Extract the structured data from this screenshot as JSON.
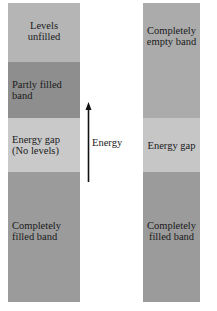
{
  "diagram": {
    "left_column": {
      "bands": [
        {
          "id": "levels-unfilled",
          "label": "Levels unfilled",
          "label_lines": [
            "Levels",
            "unfilled"
          ],
          "color": "#b5b5b5"
        },
        {
          "id": "partly-filled",
          "label": "Partly filled band",
          "label_lines": [
            "Partly filled",
            "band"
          ],
          "color": "#8e8e8e"
        },
        {
          "id": "energy-gap",
          "label": "Energy gap (No levels)",
          "label_lines": [
            "Energy gap",
            "(No levels)"
          ],
          "color": "#c9c9c9"
        },
        {
          "id": "completely-filled",
          "label": "Completely filled band",
          "label_lines": [
            "Completely",
            "filled band"
          ],
          "color": "#9b9b9b"
        }
      ]
    },
    "arrow": {
      "label": "Energy",
      "direction": "up",
      "color": "#111111"
    },
    "right_column": {
      "bands": [
        {
          "id": "completely-empty",
          "label": "Completely empty band",
          "label_lines": [
            "Completely",
            "empty band"
          ],
          "color": "#ababab"
        },
        {
          "id": "energy-gap",
          "label": "Energy gap",
          "label_lines": [
            "Energy gap"
          ],
          "color": "#c6c6c6"
        },
        {
          "id": "completely-filled",
          "label": "Completely filled band",
          "label_lines": [
            "Completely",
            "filled band"
          ],
          "color": "#9b9b9b"
        }
      ]
    }
  }
}
